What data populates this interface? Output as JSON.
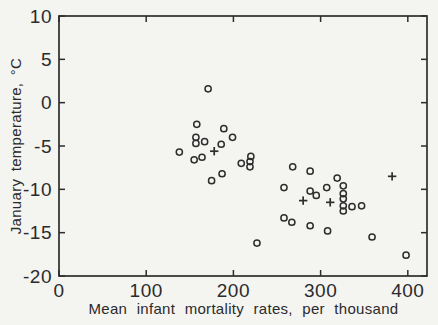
{
  "figure": {
    "xlabel": "Mean infant mortality rates, per thousand",
    "ylabel": "January temperature, °C"
  },
  "chart_data": {
    "type": "scatter",
    "title": "",
    "xlabel": "Mean infant mortality rates, per thousand",
    "ylabel": "January temperature, °C",
    "xlim": [
      0,
      422
    ],
    "ylim": [
      -20,
      10
    ],
    "xticks": [
      0,
      100,
      200,
      300,
      400
    ],
    "yticks": [
      10,
      5,
      0,
      -5,
      -10,
      -15,
      -20
    ],
    "grid": false,
    "background_color": "#f4f4f1",
    "marker_color": "#2d2d2d",
    "series": [
      {
        "name": "circle-markers",
        "marker": "circle",
        "points": [
          [
            171,
            1.6
          ],
          [
            158,
            -2.5
          ],
          [
            189,
            -3.0
          ],
          [
            157,
            -4.0
          ],
          [
            157,
            -4.7
          ],
          [
            167,
            -4.5
          ],
          [
            199,
            -4.0
          ],
          [
            186,
            -4.8
          ],
          [
            138,
            -5.7
          ],
          [
            155,
            -6.6
          ],
          [
            164,
            -6.3
          ],
          [
            175,
            -9.0
          ],
          [
            209,
            -7.0
          ],
          [
            219,
            -6.8
          ],
          [
            219,
            -7.4
          ],
          [
            220,
            -6.2
          ],
          [
            187,
            -8.2
          ],
          [
            268,
            -7.4
          ],
          [
            288,
            -7.9
          ],
          [
            319,
            -8.7
          ],
          [
            258,
            -9.8
          ],
          [
            288,
            -10.2
          ],
          [
            295,
            -10.7
          ],
          [
            307,
            -9.8
          ],
          [
            326,
            -9.6
          ],
          [
            326,
            -10.5
          ],
          [
            326,
            -11.1
          ],
          [
            326,
            -11.9
          ],
          [
            326,
            -12.5
          ],
          [
            336,
            -12.0
          ],
          [
            347,
            -11.9
          ],
          [
            258,
            -13.3
          ],
          [
            267,
            -13.8
          ],
          [
            288,
            -14.2
          ],
          [
            308,
            -14.8
          ],
          [
            359,
            -15.5
          ],
          [
            227,
            -16.2
          ],
          [
            398,
            -17.6
          ]
        ]
      },
      {
        "name": "plus-markers",
        "marker": "plus",
        "points": [
          [
            178,
            -5.6
          ],
          [
            382,
            -8.5
          ],
          [
            280,
            -11.3
          ],
          [
            311,
            -11.5
          ]
        ]
      }
    ]
  }
}
